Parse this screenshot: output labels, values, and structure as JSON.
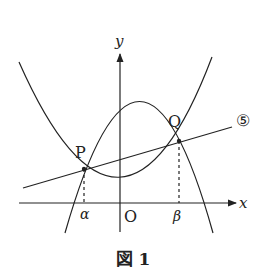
{
  "figure": {
    "caption": "図 1",
    "axes": {
      "x_label": "x",
      "y_label": "y",
      "origin_label": "O"
    },
    "points": {
      "P": {
        "label": "P",
        "x_marker": "α"
      },
      "Q": {
        "label": "Q",
        "x_marker": "β"
      }
    },
    "line_label": "⑤",
    "curves": [
      {
        "name": "upward-parabola",
        "description": "convex parabola opening upward, vertex slightly right of y-axis above x-axis"
      },
      {
        "name": "downward-parabola",
        "description": "concave parabola opening downward, vertex right of y-axis"
      },
      {
        "name": "line-5",
        "description": "straight line through P and Q labeled ⑤"
      }
    ],
    "colors": {
      "stroke": "#222222",
      "background": "#ffffff"
    }
  }
}
